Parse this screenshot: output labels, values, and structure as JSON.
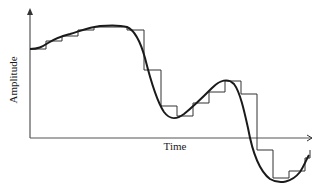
{
  "diagram": {
    "type": "sampled-signal",
    "y_axis_label": "Amplitude",
    "x_axis_label": "Time",
    "colors": {
      "line": "#1a1a1a",
      "axis": "#555555",
      "background": "#ffffff"
    },
    "axis": {
      "origin": [
        30,
        138
      ],
      "y_top": 8,
      "x_end": 312
    },
    "curve_path": "M30,49 C38,49 42,47 48,43 C56,38 62,36 70,34 C80,31 90,27 100,26 C112,25 120,25 127,27 C134,30 140,40 145,58 C150,78 156,100 164,112 C170,120 176,120 184,114 C194,106 204,96 212,88 C220,80 228,78 234,84 C240,92 244,110 248,128 C252,150 258,170 270,179 C280,185 292,182 300,172 C304,166 306,160 309,155",
    "steps": [
      {
        "x": 30,
        "w": 16,
        "y": 49
      },
      {
        "x": 46,
        "w": 16,
        "y": 41
      },
      {
        "x": 62,
        "w": 16,
        "y": 36
      },
      {
        "x": 78,
        "w": 16,
        "y": 30
      },
      {
        "x": 94,
        "w": 17,
        "y": 27
      },
      {
        "x": 111,
        "w": 16,
        "y": 27
      },
      {
        "x": 127,
        "w": 17,
        "y": 30
      },
      {
        "x": 144,
        "w": 17,
        "y": 70
      },
      {
        "x": 161,
        "w": 16,
        "y": 106
      },
      {
        "x": 177,
        "w": 16,
        "y": 116
      },
      {
        "x": 193,
        "w": 16,
        "y": 103
      },
      {
        "x": 209,
        "w": 16,
        "y": 92
      },
      {
        "x": 225,
        "w": 16,
        "y": 81
      },
      {
        "x": 241,
        "w": 16,
        "y": 94
      },
      {
        "x": 257,
        "w": 16,
        "y": 150
      },
      {
        "x": 273,
        "w": 16,
        "y": 178
      },
      {
        "x": 289,
        "w": 16,
        "y": 171
      },
      {
        "x": 305,
        "w": 5,
        "y": 158
      }
    ]
  }
}
